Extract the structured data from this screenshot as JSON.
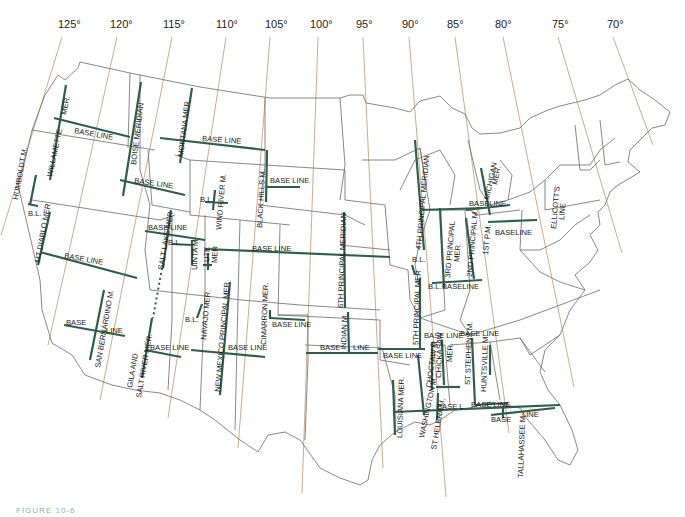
{
  "map": {
    "title": "Principal Meridians and Base Lines of the United States",
    "caption": "FIGURE 10-6",
    "colors": {
      "meridian_line": "#2f5e4c",
      "longitude_line": "#c9a27e",
      "state_border": "#6b6b6b"
    },
    "longitudes": [
      {
        "label": "125°",
        "x": 125
      },
      {
        "label": "120°",
        "x": 120
      },
      {
        "label": "115°",
        "x": 115
      },
      {
        "label": "110°",
        "x": 110
      },
      {
        "label": "105°",
        "x": 105
      },
      {
        "label": "100°",
        "x": 100
      },
      {
        "label": "95°",
        "x": 95
      },
      {
        "label": "90°",
        "x": 90
      },
      {
        "label": "85°",
        "x": 85
      },
      {
        "label": "80°",
        "x": 80
      },
      {
        "label": "75°",
        "x": 75
      },
      {
        "label": "70°",
        "x": 70
      }
    ],
    "labels": {
      "humboldt": "HUMBOLDT M.",
      "willamette": "WILLAMETTE",
      "willamette_mer": "MER.",
      "base_line": "BASE LINE",
      "baseline": "BASELINE",
      "boise": "BOISE MERIDIAN",
      "montana": "MONTANA MER",
      "bl": "B.L.",
      "mt_diablo": "MT DIABLO MER",
      "wind_river": "WIND RIVER M.",
      "black_hills": "BLACK HILLS M.",
      "salt_lake": "SALT LAKE MER",
      "uinta": "UINTA M.",
      "ute": "UTE",
      "ute_mer": "MER",
      "sixth_pm": "6TH PRINCIPAL MERIDIAN",
      "san_bernardino": "SAN BERNARDINO M.",
      "gila": "GILA AND",
      "salt_river": "SALT RIVER MER.",
      "navajo": "NAVAJO MER.",
      "new_mexico": "NEW MEXICO PRINCIPAL MER",
      "cimarron": "CIMARRON MER.",
      "indian": "INDIAN M.",
      "line": "LINE",
      "fourth_pm": "4TH PRINCIPAL MERIDIAN",
      "third_pm": "3RD PRINCIPAL",
      "third_pm_mer": "MER.",
      "second_pm": "2ND PRINCIPAL M.",
      "first_pm": "1ST P.M.",
      "michigan": "MICHIGAN",
      "michigan_mer": "MER.",
      "ellicotts": "ELLICOTT'S",
      "ellicotts_line": "LINE",
      "fifth_pm": "5TH PRINCIPAL MER",
      "chickasaw": "CHICKASAW",
      "chickasaw_mer": "MER.",
      "choctaw": "CHOCTAW M.",
      "st_stephens": "ST STEPHENS M.",
      "huntsville": "HUNTSVILLE M.",
      "louisiana": "LOUISIANA MER.",
      "washington": "WASHINGTON M.",
      "st_helena": "ST HELENA M.",
      "base_l": "BASE L",
      "base": "BASE",
      "tallahassee": "TALLAHASSEE M."
    }
  }
}
